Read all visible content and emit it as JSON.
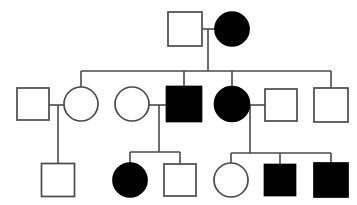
{
  "diagram": {
    "type": "pedigree-chart",
    "title": "",
    "canvas": {
      "width": 357,
      "height": 205
    },
    "legend": {
      "square_meaning": "male",
      "circle_meaning": "female",
      "filled_meaning": "affected",
      "unfilled_meaning": "unaffected"
    },
    "colors": {
      "affected_fill": "#000000",
      "unaffected_fill": "#ffffff",
      "stroke": "#4a4a4a",
      "background": "#ffffff"
    },
    "generations": [
      {
        "id": "I",
        "label": "I",
        "y": 29,
        "individuals": [
          {
            "id": "I-1",
            "shape": "square",
            "sex": "male",
            "status": "unaffected",
            "x": 185,
            "y": 29,
            "size": 34
          },
          {
            "id": "I-2",
            "shape": "circle",
            "sex": "female",
            "status": "affected",
            "x": 232,
            "y": 29,
            "size": 34
          }
        ]
      },
      {
        "id": "II",
        "label": "II",
        "y": 104,
        "individuals": [
          {
            "id": "II-1",
            "shape": "square",
            "sex": "male",
            "status": "unaffected",
            "x": 33,
            "y": 104,
            "size": 32
          },
          {
            "id": "II-2",
            "shape": "circle",
            "sex": "female",
            "status": "unaffected",
            "x": 81,
            "y": 104,
            "size": 34
          },
          {
            "id": "II-3",
            "shape": "circle",
            "sex": "female",
            "status": "unaffected",
            "x": 132,
            "y": 104,
            "size": 34
          },
          {
            "id": "II-4",
            "shape": "square",
            "sex": "male",
            "status": "affected",
            "x": 184,
            "y": 104,
            "size": 35
          },
          {
            "id": "II-5",
            "shape": "circle",
            "sex": "female",
            "status": "affected",
            "x": 232,
            "y": 104,
            "size": 35
          },
          {
            "id": "II-6",
            "shape": "square",
            "sex": "male",
            "status": "unaffected",
            "x": 281,
            "y": 105,
            "size": 32
          },
          {
            "id": "II-7",
            "shape": "square",
            "sex": "male",
            "status": "unaffected",
            "x": 331,
            "y": 105,
            "size": 34
          }
        ]
      },
      {
        "id": "III",
        "label": "III",
        "y": 180,
        "individuals": [
          {
            "id": "III-1",
            "shape": "square",
            "sex": "male",
            "status": "unaffected",
            "x": 58,
            "y": 180,
            "size": 33
          },
          {
            "id": "III-2",
            "shape": "circle",
            "sex": "female",
            "status": "affected",
            "x": 130,
            "y": 180,
            "size": 34
          },
          {
            "id": "III-3",
            "shape": "square",
            "sex": "male",
            "status": "unaffected",
            "x": 180,
            "y": 180,
            "size": 32
          },
          {
            "id": "III-4",
            "shape": "circle",
            "sex": "female",
            "status": "unaffected",
            "x": 231,
            "y": 180,
            "size": 34
          },
          {
            "id": "III-5",
            "shape": "square",
            "sex": "male",
            "status": "affected",
            "x": 280,
            "y": 180,
            "size": 31
          },
          {
            "id": "III-6",
            "shape": "square",
            "sex": "male",
            "status": "affected",
            "x": 331,
            "y": 180,
            "size": 34
          }
        ]
      }
    ],
    "matings": [
      {
        "id": "mating-I",
        "partners": [
          "I-1",
          "I-2"
        ],
        "mating_line": {
          "x1": 202,
          "x2": 215,
          "y": 29
        },
        "descent": {
          "x": 208,
          "y1": 29,
          "y2": 71
        },
        "sibship_bar": {
          "x1": 81,
          "x2": 331,
          "y": 71
        },
        "children": [
          "II-2",
          "II-4",
          "II-5",
          "II-7"
        ],
        "child_drops": [
          {
            "x": 81,
            "y1": 71,
            "y2": 88
          },
          {
            "x": 184,
            "y1": 71,
            "y2": 87
          },
          {
            "x": 232,
            "y1": 71,
            "y2": 87
          },
          {
            "x": 331,
            "y1": 71,
            "y2": 89
          }
        ]
      },
      {
        "id": "mating-II-A",
        "partners": [
          "II-1",
          "II-2"
        ],
        "mating_line": {
          "x1": 49,
          "x2": 64,
          "y": 105
        },
        "descent": {
          "x": 58,
          "y1": 105,
          "y2": 164
        },
        "sibship_bar": null,
        "children": [
          "III-1"
        ],
        "child_drops": []
      },
      {
        "id": "mating-II-B",
        "partners": [
          "II-3",
          "II-4"
        ],
        "mating_line": {
          "x1": 149,
          "x2": 167,
          "y": 105
        },
        "descent": {
          "x": 159,
          "y1": 105,
          "y2": 152
        },
        "sibship_bar": {
          "x1": 130,
          "x2": 180,
          "y": 152
        },
        "children": [
          "III-2",
          "III-3"
        ],
        "child_drops": [
          {
            "x": 130,
            "y1": 152,
            "y2": 165
          },
          {
            "x": 180,
            "y1": 152,
            "y2": 164
          }
        ]
      },
      {
        "id": "mating-II-C",
        "partners": [
          "II-5",
          "II-6"
        ],
        "mating_line": {
          "x1": 249,
          "x2": 265,
          "y": 105
        },
        "descent": {
          "x": 250,
          "y1": 105,
          "y2": 153
        },
        "sibship_bar": {
          "x1": 231,
          "x2": 331,
          "y": 153
        },
        "children": [
          "III-4",
          "III-5",
          "III-6"
        ],
        "child_drops": [
          {
            "x": 231,
            "y1": 153,
            "y2": 164
          },
          {
            "x": 280,
            "y1": 153,
            "y2": 165
          },
          {
            "x": 331,
            "y1": 153,
            "y2": 164
          }
        ]
      }
    ],
    "counts": {
      "total_individuals": 15,
      "affected_individuals": 6,
      "unaffected_individuals": 9,
      "generation_count": 3
    }
  }
}
